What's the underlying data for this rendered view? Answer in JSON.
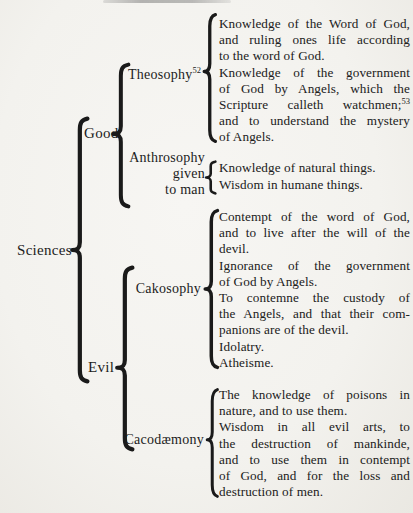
{
  "diagram": {
    "root_label": "Sciences",
    "good": {
      "label": "Good",
      "theosophy": {
        "label": "Theosophy",
        "label_sup": "52",
        "footnote_ref": "53",
        "lines": [
          "Knowledge of the Word of God,",
          "and ruling ones life according",
          "to the word of God.",
          "Knowledge of the government",
          "of God by Angels, which the",
          "Scripture calleth watchmen;",
          "and to understand the mystery",
          "of Angels."
        ]
      },
      "anthrosophy": {
        "label": "Anthrosophy",
        "label_line2": "given",
        "label_line3": "to man",
        "lines": [
          "Knowledge of natural things.",
          "Wisdom in humane things."
        ]
      }
    },
    "evil": {
      "label": "Evil",
      "cakosophy": {
        "label": "Cakosophy",
        "lines": [
          "Contempt of the word of God,",
          "and to live after the will of the",
          "devil.",
          "Ignorance of the government",
          "of God by Angels.",
          "To contemne the custody of",
          "the Angels, and that their com-",
          "panions are of the devil.",
          "Idolatry.",
          "Atheisme."
        ]
      },
      "cacodaemony": {
        "label": "Cacodæmony",
        "lines": [
          "The knowledge of poisons in",
          "nature, and to use them.",
          "Wisdom in all evil arts, to",
          "the destruction of mankinde,",
          "and to use them in contempt",
          "of God, and for the loss and",
          "destruction of men."
        ]
      }
    }
  }
}
